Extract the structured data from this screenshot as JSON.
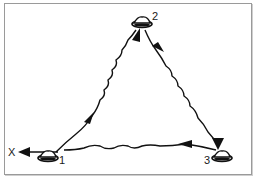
{
  "diagram": {
    "type": "drill-diagram",
    "start_label": "X",
    "stations": [
      {
        "id": "cone-1",
        "label": "1"
      },
      {
        "id": "cone-2",
        "label": "2"
      },
      {
        "id": "cone-3",
        "label": "3"
      }
    ],
    "paths": [
      {
        "from": "1",
        "to": "2",
        "style": "wavy",
        "arrows": 2
      },
      {
        "from": "2",
        "to": "3",
        "style": "wavy",
        "arrows": 2
      },
      {
        "from": "3",
        "to": "1",
        "style": "wavy",
        "arrows": 1
      },
      {
        "from": "1",
        "to": "X",
        "style": "straight",
        "arrows": 1
      }
    ],
    "colors": {
      "stroke": "#111111",
      "frame": "#9a9a9a"
    }
  }
}
